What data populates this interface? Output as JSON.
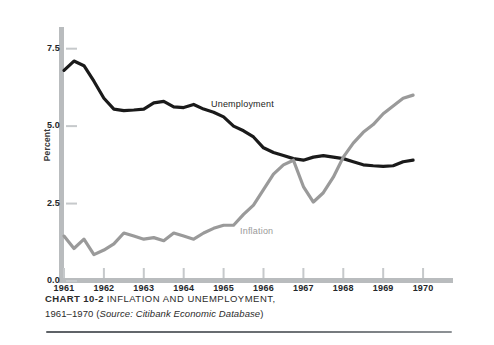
{
  "caption": {
    "chart_number": "CHART 10-2",
    "title": "INFLATION AND UNEMPLOYMENT,",
    "line2_prefix": "1961–1970 (",
    "source_label": "Source:",
    "source_name": "Citibank Economic Database",
    "line2_suffix": ")"
  },
  "chart_data": {
    "type": "line",
    "title": "INFLATION AND UNEMPLOYMENT, 1961–1970",
    "xlabel": "",
    "ylabel": "Percent",
    "xlim": [
      1961,
      1970.75
    ],
    "ylim": [
      0.0,
      8.2
    ],
    "yticks": [
      0.0,
      2.5,
      5.0,
      7.5
    ],
    "ytick_labels": [
      "0.0",
      "2.5",
      "5.0",
      "7.5"
    ],
    "xticks": [
      1961,
      1962,
      1963,
      1964,
      1965,
      1966,
      1967,
      1968,
      1969,
      1970
    ],
    "xtick_labels": [
      "1961",
      "1962",
      "1963",
      "1964",
      "1965",
      "1966",
      "1967",
      "1968",
      "1969",
      "1970"
    ],
    "grid": false,
    "legend": "inline-annotations",
    "annotations": [
      {
        "text": "Unemployment",
        "x": 1964.7,
        "y": 5.75,
        "color": "#1c1c1c"
      },
      {
        "text": "Inflation",
        "x": 1965.8,
        "y": 1.55,
        "color": "#9a9a9a"
      }
    ],
    "series": [
      {
        "name": "Unemployment",
        "color": "#1a1a1a",
        "x": [
          1961.0,
          1961.25,
          1961.5,
          1961.75,
          1962.0,
          1962.25,
          1962.5,
          1962.75,
          1963.0,
          1963.25,
          1963.5,
          1963.75,
          1964.0,
          1964.25,
          1964.5,
          1964.75,
          1965.0,
          1965.25,
          1965.5,
          1965.75,
          1966.0,
          1966.25,
          1966.5,
          1966.75,
          1967.0,
          1967.25,
          1967.5,
          1967.75,
          1968.0,
          1968.25,
          1968.5,
          1968.75,
          1969.0,
          1969.25,
          1969.5,
          1969.75
        ],
        "values": [
          6.8,
          7.1,
          6.95,
          6.45,
          5.9,
          5.55,
          5.5,
          5.52,
          5.55,
          5.75,
          5.8,
          5.62,
          5.6,
          5.7,
          5.55,
          5.45,
          5.3,
          5.0,
          4.85,
          4.65,
          4.3,
          4.15,
          4.05,
          3.95,
          3.9,
          4.0,
          4.05,
          4.0,
          3.95,
          3.85,
          3.75,
          3.72,
          3.7,
          3.72,
          3.85,
          3.9
        ]
      },
      {
        "name": "Inflation",
        "color": "#9a9a9a",
        "x": [
          1961.0,
          1961.25,
          1961.5,
          1961.75,
          1962.0,
          1962.25,
          1962.5,
          1962.75,
          1963.0,
          1963.25,
          1963.5,
          1963.75,
          1964.0,
          1964.25,
          1964.5,
          1964.75,
          1965.0,
          1965.25,
          1965.5,
          1965.75,
          1966.0,
          1966.25,
          1966.5,
          1966.75,
          1967.0,
          1967.25,
          1967.5,
          1967.75,
          1968.0,
          1968.25,
          1968.5,
          1968.75,
          1969.0,
          1969.25,
          1969.5,
          1969.75
        ],
        "values": [
          1.45,
          1.05,
          1.35,
          0.85,
          1.0,
          1.2,
          1.55,
          1.45,
          1.35,
          1.4,
          1.3,
          1.55,
          1.45,
          1.35,
          1.55,
          1.7,
          1.8,
          1.8,
          2.15,
          2.45,
          2.95,
          3.45,
          3.75,
          3.9,
          3.05,
          2.55,
          2.85,
          3.35,
          4.0,
          4.45,
          4.8,
          5.05,
          5.4,
          5.65,
          5.9,
          6.0
        ]
      }
    ]
  },
  "axes": {
    "y_axis_color": "#b9bcbe",
    "x_axis_color": "#b9bcbe"
  }
}
